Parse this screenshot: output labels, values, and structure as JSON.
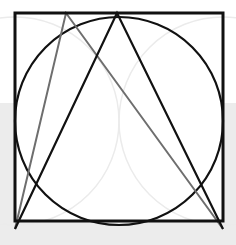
{
  "canvas": {
    "width": 236,
    "height": 245
  },
  "colors": {
    "background_top": "#ffffff",
    "background_bottom": "#ececec",
    "square_fill": "#ffffff",
    "stroke_black": "#111111",
    "stroke_gray": "#6e6e6e",
    "stroke_faint": "#ebebeb"
  },
  "square": {
    "x": 15,
    "y": 13,
    "size": 208,
    "stroke_width": 3
  },
  "inscribed_circle": {
    "cx": 119,
    "cy": 121,
    "r": 104,
    "stroke_width": 2.2
  },
  "faint_circles": [
    {
      "cx": 15,
      "cy": 121,
      "r": 104
    },
    {
      "cx": 223,
      "cy": 121,
      "r": 104
    }
  ],
  "black_triangle": {
    "apex": [
      117,
      13
    ],
    "base_left": [
      15,
      229
    ],
    "base_right": [
      223,
      229
    ]
  },
  "gray_triangle": {
    "apex": [
      66,
      13
    ],
    "base_left": [
      15,
      229
    ],
    "base_right": [
      223,
      229
    ]
  }
}
